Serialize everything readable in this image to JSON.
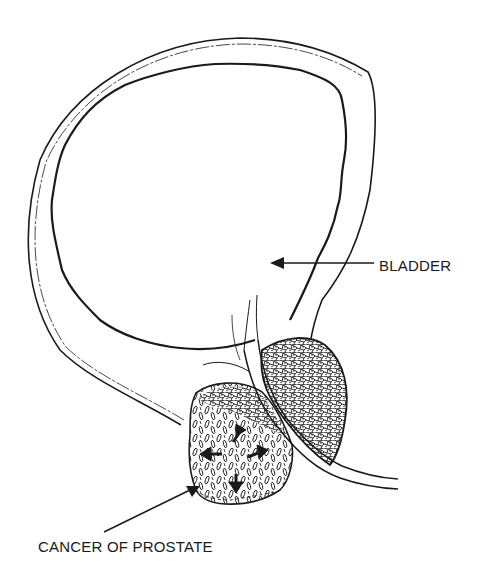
{
  "diagram": {
    "labels": {
      "bladder": "BLADDER",
      "cancer": "CANCER OF PROSTATE"
    },
    "colors": {
      "line": "#1a1a1a",
      "background": "#ffffff"
    },
    "structures": [
      {
        "name": "bladder-outer-wall"
      },
      {
        "name": "bladder-inner-mucosa"
      },
      {
        "name": "prostate-normal-lobe"
      },
      {
        "name": "prostate-tumor-lobe"
      },
      {
        "name": "urethra"
      }
    ],
    "tumor_spread_arrows": [
      "up-right",
      "left",
      "right",
      "down"
    ]
  }
}
